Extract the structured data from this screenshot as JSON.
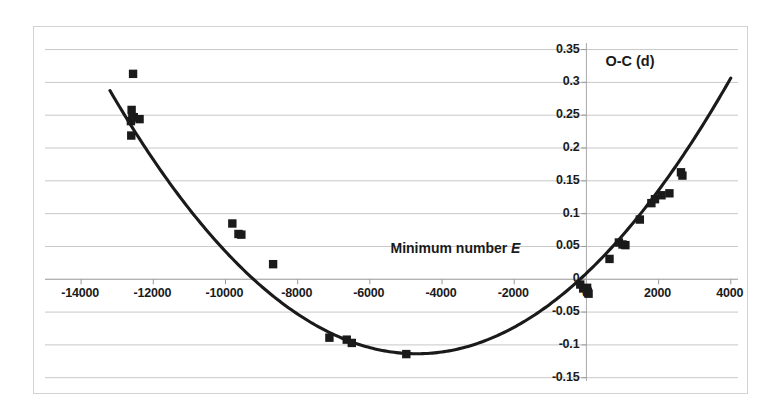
{
  "chart_data": {
    "type": "scatter",
    "title": "",
    "xlabel": "Minimum number E",
    "ylabel": "O-C (d)",
    "xlim": [
      -15000,
      4200
    ],
    "ylim": [
      -0.155,
      0.36
    ],
    "xticks": [
      -14000,
      -12000,
      -10000,
      -8000,
      -6000,
      -4000,
      -2000,
      0,
      2000,
      4000
    ],
    "xtick_labels": [
      "-14000",
      "-12000",
      "-10000",
      "-8000",
      "-6000",
      "-4000",
      "-2000",
      "0",
      "2000",
      "4000"
    ],
    "yticks": [
      0.35,
      0.3,
      0.25,
      0.2,
      0.15,
      0.1,
      0.05,
      0,
      -0.05,
      -0.1,
      -0.15
    ],
    "ytick_labels": [
      "0.35",
      "0.3",
      "0.25",
      "0.2",
      "0.15",
      "0.1",
      "0.05",
      "0",
      "-0.05",
      "-0.1",
      "-0.15"
    ],
    "grid": "horizontal",
    "legend": "none",
    "marker": "filled-square",
    "marker_color": "#1a1a1a",
    "curve_color": "#1a1a1a",
    "frame_color": "#d3d3d3",
    "points": [
      {
        "x": -12560,
        "y": 0.313
      },
      {
        "x": -12600,
        "y": 0.258
      },
      {
        "x": -12620,
        "y": 0.241
      },
      {
        "x": -12580,
        "y": 0.247
      },
      {
        "x": -12540,
        "y": 0.247
      },
      {
        "x": -12380,
        "y": 0.244
      },
      {
        "x": -12610,
        "y": 0.219
      },
      {
        "x": -9810,
        "y": 0.085
      },
      {
        "x": -9640,
        "y": 0.069
      },
      {
        "x": -9560,
        "y": 0.068
      },
      {
        "x": -8680,
        "y": 0.023
      },
      {
        "x": -7120,
        "y": -0.089
      },
      {
        "x": -6640,
        "y": -0.092
      },
      {
        "x": -6500,
        "y": -0.097
      },
      {
        "x": -4990,
        "y": -0.114
      },
      {
        "x": -170,
        "y": -0.008
      },
      {
        "x": -90,
        "y": -0.014
      },
      {
        "x": 20,
        "y": -0.013
      },
      {
        "x": 40,
        "y": -0.019
      },
      {
        "x": 60,
        "y": -0.022
      },
      {
        "x": 640,
        "y": 0.031
      },
      {
        "x": 900,
        "y": 0.056
      },
      {
        "x": 1000,
        "y": 0.053
      },
      {
        "x": 1080,
        "y": 0.052
      },
      {
        "x": 1480,
        "y": 0.091
      },
      {
        "x": 1800,
        "y": 0.116
      },
      {
        "x": 1900,
        "y": 0.122
      },
      {
        "x": 2080,
        "y": 0.128
      },
      {
        "x": 2300,
        "y": 0.131
      },
      {
        "x": 2620,
        "y": 0.163
      },
      {
        "x": 2660,
        "y": 0.158
      }
    ],
    "fit_curve": {
      "description": "parabola",
      "vertex_x": -4700,
      "vertex_y": -0.1135,
      "a": 5.55e-09,
      "x_start": -13200,
      "x_end": 4000
    }
  }
}
